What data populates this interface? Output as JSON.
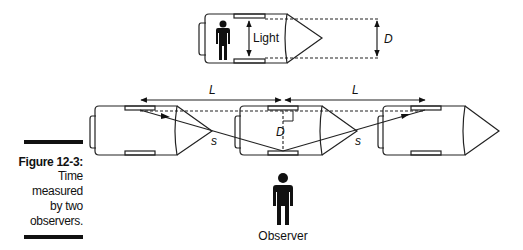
{
  "caption": {
    "title": "Figure 12-3:",
    "lines": [
      "Time",
      "measured",
      "by two",
      "observers."
    ]
  },
  "top_rocket": {
    "light_label": "Light",
    "distance_label": "D"
  },
  "moving_rockets": {
    "length_labels": [
      "L",
      "L"
    ],
    "distance_label": "D",
    "path_labels": [
      "s",
      "s"
    ]
  },
  "observer": {
    "label": "Observer"
  }
}
